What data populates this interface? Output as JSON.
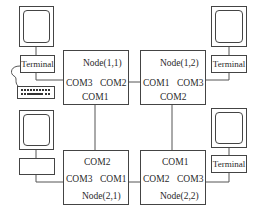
{
  "diagram": {
    "nodes": [
      {
        "id": "n11",
        "title": "Node(1,1)",
        "ports": {
          "left": "COM3",
          "right": "COM2",
          "bottom": "COM1"
        }
      },
      {
        "id": "n12",
        "title": "Node(1,2)",
        "ports": {
          "left": "COM1",
          "right": "COM3",
          "bottom": "COM2"
        }
      },
      {
        "id": "n21",
        "title": "Node(2,1)",
        "ports": {
          "top": "COM2",
          "left": "COM3",
          "right": "COM1"
        }
      },
      {
        "id": "n22",
        "title": "Node(2,2)",
        "ports": {
          "top": "COM1",
          "left": "COM2",
          "right": "COM3"
        }
      }
    ],
    "terminals": [
      {
        "id": "t11",
        "label": "Terminal",
        "has_keyboard": true
      },
      {
        "id": "t12",
        "label": "Terminal"
      },
      {
        "id": "t21",
        "label": ""
      },
      {
        "id": "t22",
        "label": "Terminal"
      }
    ],
    "links": [
      {
        "from": "Node(1,1).COM2",
        "to": "Node(1,2).COM1"
      },
      {
        "from": "Node(1,1).COM1",
        "to": "Node(2,1).COM2"
      },
      {
        "from": "Node(1,2).COM2",
        "to": "Node(2,2).COM1"
      },
      {
        "from": "Node(2,1).COM1",
        "to": "Node(2,2).COM2"
      },
      {
        "from": "Terminal(1,1)",
        "to": "Node(1,1).COM3"
      },
      {
        "from": "Terminal(1,2)",
        "to": "Node(1,2).COM3"
      },
      {
        "from": "Terminal(2,1)",
        "to": "Node(2,1).COM3"
      },
      {
        "from": "Terminal(2,2)",
        "to": "Node(2,2).COM3"
      }
    ]
  }
}
